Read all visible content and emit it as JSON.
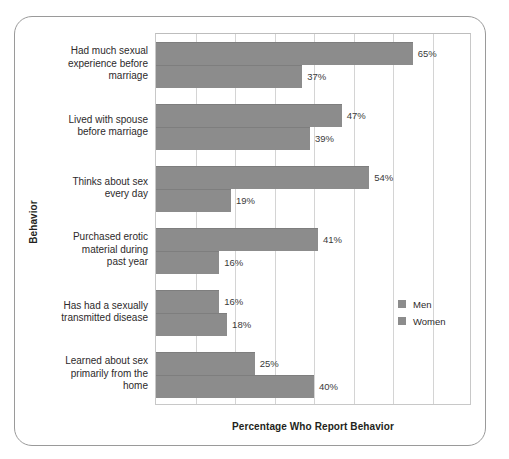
{
  "chart_data": {
    "type": "bar",
    "orientation": "horizontal",
    "title": "",
    "xlabel": "Percentage Who Report Behavior",
    "ylabel": "Behavior",
    "xlim": [
      0,
      80
    ],
    "xtick_interval": 10,
    "grid": true,
    "grid_axis": "x",
    "legend_position": "right",
    "bar_color": "#8c8c8c",
    "categories": [
      "Had much sexual experience before marriage",
      "Lived with spouse before marriage",
      "Thinks about sex every day",
      "Purchased erotic material during past year",
      "Has had a sexually transmitted disease",
      "Learned about sex primarily from the home"
    ],
    "category_label_lines": [
      [
        "Had much sexual",
        "experience before",
        "marriage"
      ],
      [
        "Lived with spouse",
        "before marriage"
      ],
      [
        "Thinks about sex",
        "every day"
      ],
      [
        "Purchased erotic",
        "material during",
        "past year"
      ],
      [
        "Has had a sexually",
        "transmitted disease"
      ],
      [
        "Learned about sex",
        "primarily from the",
        "home"
      ]
    ],
    "series": [
      {
        "name": "Men",
        "values": [
          65,
          47,
          54,
          41,
          16,
          25
        ],
        "value_labels": [
          "65%",
          "47%",
          "54%",
          "41%",
          "16%",
          "25%"
        ]
      },
      {
        "name": "Women",
        "values": [
          37,
          39,
          19,
          16,
          18,
          40
        ],
        "value_labels": [
          "37%",
          "39%",
          "19%",
          "16%",
          "18%",
          "40%"
        ]
      }
    ]
  },
  "legend": {
    "items": [
      {
        "label": "Men",
        "color": "#8c8c8c"
      },
      {
        "label": "Women",
        "color": "#8c8c8c"
      }
    ]
  },
  "axes": {
    "x_title": "Percentage Who Report Behavior",
    "y_title": "Behavior"
  }
}
